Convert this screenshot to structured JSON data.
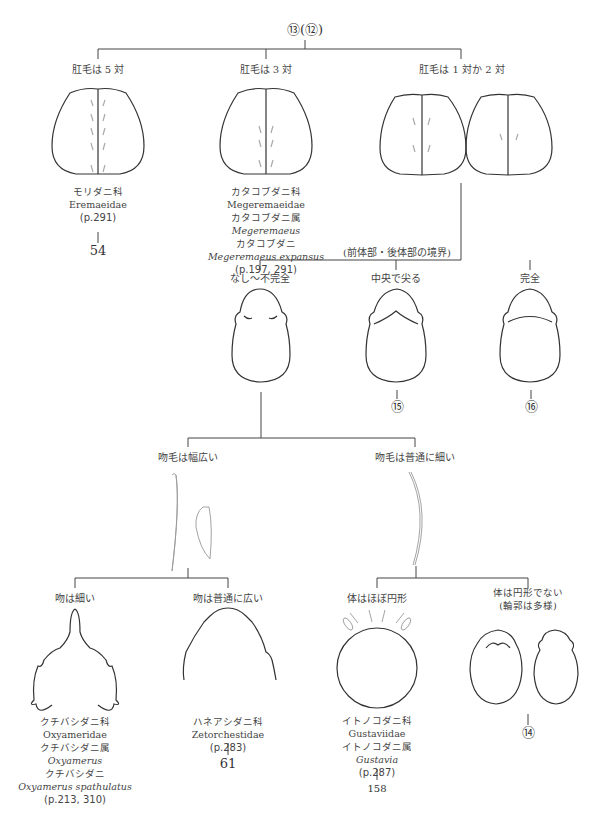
{
  "root": {
    "label": "⑬(⑫)"
  },
  "level1": [
    {
      "criterion": "肛毛は 5 対",
      "taxon": {
        "family_jp": "モリダニ科",
        "family": "Eremaeidae",
        "page": "(p.291)"
      },
      "next": "54"
    },
    {
      "criterion": "肛毛は 3 対",
      "taxon": {
        "family_jp": "カタコブダニ科",
        "family": "Megeremaeidae",
        "genus_jp": "カタコブダニ属",
        "genus": "Megeremaeus",
        "species_jp": "カタコブダニ",
        "species": "Megeremaeus expansus",
        "page": "(p.197, 291)"
      }
    },
    {
      "criterion": "肛毛は 1 対か 2 対"
    }
  ],
  "level2": {
    "heading": "(前体部・後体部の境界)",
    "options": [
      {
        "criterion": "なし〜不完全"
      },
      {
        "criterion": "中央で尖る",
        "next": "15"
      },
      {
        "criterion": "完全",
        "next": "16"
      }
    ]
  },
  "level3": [
    {
      "criterion": "吻毛は幅広い"
    },
    {
      "criterion": "吻毛は普通に細い"
    }
  ],
  "level4": [
    {
      "criterion": "吻は細い",
      "taxon": {
        "family_jp": "クチバシダニ科",
        "family": "Oxyameridae",
        "genus_jp": "クチバシダニ属",
        "genus": "Oxyamerus",
        "species_jp": "クチバシダニ",
        "species": "Oxyamerus spathulatus",
        "page": "(p.213, 310)"
      }
    },
    {
      "criterion": "吻は普通に広い",
      "taxon": {
        "family_jp": "ハネアシダニ科",
        "family": "Zetorchestidae",
        "page": "(p.283)"
      },
      "next": "61"
    },
    {
      "criterion": "体はほぼ円形",
      "taxon": {
        "family_jp": "イトノコダニ科",
        "family": "Gustaviidae",
        "genus_jp": "イトノコダニ属",
        "genus": "Gustavia",
        "page": "(p.287)"
      },
      "next": "158"
    },
    {
      "criterion": "体は円形でない",
      "criterion2": "(輪郭は多様)",
      "next": "14"
    }
  ],
  "nodes": {
    "n54": "㊿④",
    "n15": "⑮",
    "n16": "⑯",
    "n61": "61",
    "n158": "158",
    "n14": "⑭"
  }
}
